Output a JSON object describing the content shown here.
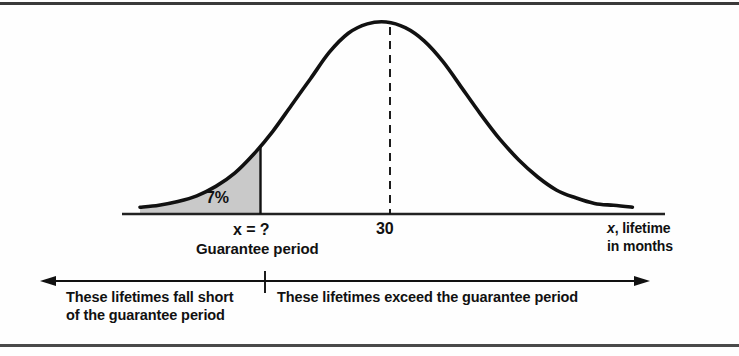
{
  "figure": {
    "shaded_color": "#c9c9c9",
    "curve_color": "#111111",
    "axis_color": "#222222"
  },
  "labels": {
    "percent": "7%",
    "x_unknown_var": "x",
    "x_unknown_rest": " = ?",
    "guarantee": "Guarantee period",
    "mean": "30",
    "axis_title_var": "x",
    "axis_title_rest": ", lifetime",
    "axis_title_line2": "in months"
  },
  "notes": {
    "left_line1": "These lifetimes fall short",
    "left_line2": "of the guarantee period",
    "right_line1": "These lifetimes exceed the guarantee period"
  },
  "chart_data": {
    "type": "line",
    "title": "",
    "subtitle": "",
    "xlabel": "x, lifetime in months",
    "ylabel": "",
    "distribution": "normal",
    "mean": 30,
    "mean_tick_label": "30",
    "shaded_tail": "left",
    "shaded_area_percent": 7,
    "shaded_area_label": "7%",
    "shaded_boundary_label": "x = ?",
    "shaded_boundary_description": "Guarantee period",
    "grid": false,
    "legend": false,
    "xlim": [
      16.8,
      43.2
    ],
    "ylim": [
      0,
      1
    ],
    "tick_labels": [
      "x = ?",
      "30"
    ],
    "annotations": [
      "These lifetimes fall short of the guarantee period",
      "These lifetimes exceed the guarantee period"
    ],
    "x": [
      16.8,
      17.8,
      18.8,
      19.8,
      20.8,
      21.8,
      22.8,
      23.8,
      24.8,
      25.8,
      26.8,
      27.8,
      28.8,
      29.8,
      30.8,
      31.8,
      32.8,
      33.8,
      34.8,
      35.8,
      36.8,
      37.8,
      38.8,
      39.8,
      40.8,
      41.8,
      42.8
    ],
    "y": [
      0.02,
      0.03,
      0.05,
      0.08,
      0.13,
      0.2,
      0.3,
      0.42,
      0.56,
      0.7,
      0.84,
      0.94,
      0.99,
      1.0,
      0.97,
      0.9,
      0.79,
      0.65,
      0.51,
      0.38,
      0.27,
      0.18,
      0.11,
      0.07,
      0.04,
      0.03,
      0.02
    ]
  }
}
